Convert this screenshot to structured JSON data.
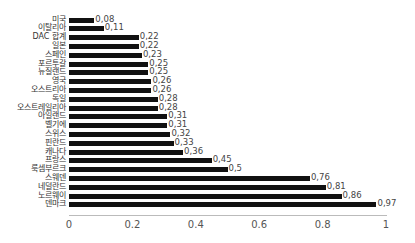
{
  "chart_data": {
    "type": "bar",
    "orientation": "horizontal",
    "title": "",
    "xlabel": "",
    "ylabel": "",
    "xlim": [
      0,
      1
    ],
    "x_ticks": [
      "0",
      "0.2",
      "0.4",
      "0.6",
      "0.8",
      "1"
    ],
    "grid": false,
    "legend": null,
    "bar_color": "#111111",
    "categories": [
      "미국",
      "이탈리아",
      "DAC 합계",
      "일본",
      "스페인",
      "포르투갈",
      "뉴질랜드",
      "영국",
      "오스트리아",
      "독일",
      "오스트레일리아",
      "아일랜드",
      "벨기에",
      "스위스",
      "핀란드",
      "캐나다",
      "프랑스",
      "룩셈부르크",
      "스웨덴",
      "네덜란드",
      "노르웨이",
      "덴마크"
    ],
    "values": [
      0.08,
      0.11,
      0.22,
      0.22,
      0.23,
      0.25,
      0.25,
      0.26,
      0.26,
      0.28,
      0.28,
      0.31,
      0.31,
      0.32,
      0.33,
      0.36,
      0.45,
      0.5,
      0.76,
      0.81,
      0.86,
      0.97
    ],
    "value_labels": [
      "0,08",
      "0,11",
      "0,22",
      "0,22",
      "0,23",
      "0,25",
      "0,25",
      "0,26",
      "0,26",
      "0,28",
      "0,28",
      "0,31",
      "0,31",
      "0,32",
      "0,33",
      "0,36",
      "0,45",
      "0,5",
      "0,76",
      "0,81",
      "0,86",
      "0,97"
    ]
  }
}
